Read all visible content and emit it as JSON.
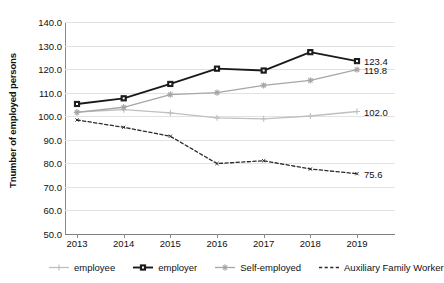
{
  "chart_data": {
    "type": "line",
    "title": "",
    "xlabel": "",
    "ylabel": "Tnumber of employed persons",
    "categories": [
      "2013",
      "2014",
      "2015",
      "2016",
      "2017",
      "2018",
      "2019"
    ],
    "x": [
      2013,
      2014,
      2015,
      2016,
      2017,
      2018,
      2019
    ],
    "ylim": [
      50.0,
      140.0
    ],
    "ytick_labels": [
      "140.0",
      "130.0",
      "120.0",
      "110.0",
      "100.0",
      "90.0",
      "80.0",
      "70.0",
      "60.0",
      "50.0"
    ],
    "ytick_values": [
      140.0,
      130.0,
      120.0,
      110.0,
      100.0,
      90.0,
      80.0,
      70.0,
      60.0,
      50.0
    ],
    "ytick_step": 10.0,
    "grid": true,
    "legend_position": "bottom",
    "series": [
      {
        "name": "employee",
        "values": [
          101.8,
          102.8,
          101.4,
          99.3,
          98.9,
          100.1,
          102.0
        ],
        "color": "#bfbfbf",
        "style": "solid",
        "marker": "plus",
        "end_label": "102.0"
      },
      {
        "name": "employer",
        "values": [
          105.2,
          107.6,
          113.7,
          120.2,
          119.4,
          127.2,
          123.4
        ],
        "color": "#1a1a1a",
        "style": "solid",
        "marker": "square",
        "end_label": "123.4"
      },
      {
        "name": "Self-employed",
        "values": [
          101.6,
          103.8,
          109.2,
          110.0,
          113.1,
          115.2,
          119.8
        ],
        "color": "#a6a6a6",
        "style": "solid",
        "marker": "star",
        "end_label": "119.8"
      },
      {
        "name": "Auxiliary Family Worker",
        "values": [
          98.4,
          95.3,
          91.5,
          79.9,
          81.1,
          77.6,
          75.6
        ],
        "color": "#2b2b2b",
        "style": "dashed",
        "marker": "tick",
        "end_label": "75.6"
      }
    ],
    "data_labels": [
      {
        "text": "123.4",
        "series": "employer",
        "value": 123.4
      },
      {
        "text": "119.8",
        "series": "Self-employed",
        "value": 119.8
      },
      {
        "text": "102.0",
        "series": "employee",
        "value": 102.0
      },
      {
        "text": "75.6",
        "series": "Auxiliary Family Worker",
        "value": 75.6
      }
    ]
  },
  "legend": {
    "items": [
      {
        "label": "employee",
        "marker": "plus-marker",
        "color": "#bfbfbf",
        "style": "solid"
      },
      {
        "label": "employer",
        "marker": "square-marker",
        "color": "#1a1a1a",
        "style": "solid"
      },
      {
        "label": "Self-employed",
        "marker": "star-marker",
        "color": "#a6a6a6",
        "style": "solid"
      },
      {
        "label": "Auxiliary Family Worker",
        "marker": "dash-marker",
        "color": "#2b2b2b",
        "style": "dashed"
      }
    ]
  },
  "colors": {
    "employee": "#bfbfbf",
    "employer": "#1a1a1a",
    "self_employed": "#a6a6a6",
    "auxiliary": "#2b2b2b",
    "gridline": "#e2e2e2",
    "axis": "#8a8a8a",
    "background": "#ffffff",
    "text": "#111111"
  }
}
